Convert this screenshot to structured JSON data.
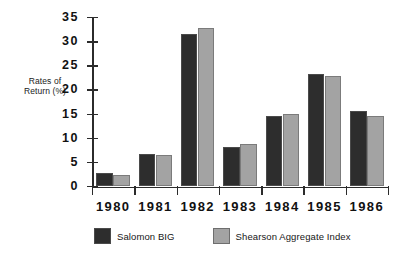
{
  "chart_data": {
    "type": "bar",
    "title": "",
    "subtitle": "",
    "xlabel": "",
    "ylabel": "Rates of\nReturn (%)",
    "ylabel_line1": "Rates of",
    "ylabel_line2": "Return (%)",
    "categories": [
      "1980",
      "1981",
      "1982",
      "1983",
      "1984",
      "1985",
      "1986"
    ],
    "series": [
      {
        "name": "Salomon BIG",
        "color": "#2d2d2d",
        "values": [
          2.7,
          6.8,
          31.6,
          8.2,
          14.5,
          23.2,
          15.7
        ]
      },
      {
        "name": "Shearson Aggregate Index",
        "color": "#a3a3a3",
        "values": [
          2.4,
          6.5,
          32.9,
          8.7,
          14.9,
          22.8,
          14.6
        ]
      }
    ],
    "ylim": [
      0,
      35
    ],
    "yticks": [
      "0",
      "5",
      "10",
      "15",
      "20",
      "25",
      "30",
      "35"
    ],
    "ytick_values": [
      0,
      5,
      10,
      15,
      20,
      25,
      30,
      35
    ],
    "grid": false,
    "legend_position": "bottom"
  },
  "legend": {
    "items": [
      {
        "label": "Salomon BIG",
        "color": "#2d2d2d"
      },
      {
        "label": "Shearson Aggregate Index",
        "color": "#a3a3a3"
      }
    ]
  }
}
